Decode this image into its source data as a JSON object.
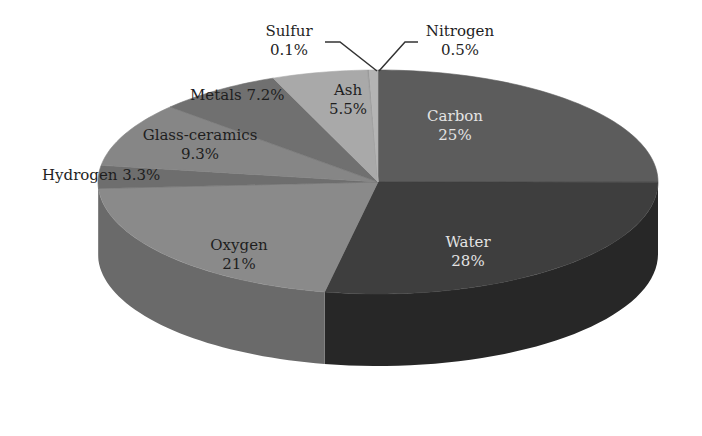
{
  "chart_data": {
    "type": "pie",
    "variant": "3d-pie",
    "title": "",
    "start_angle_deg": 0,
    "direction": "clockwise",
    "categories": [
      "Carbon",
      "Water",
      "Oxygen",
      "Hydrogen",
      "Glass-ceramics",
      "Metals",
      "Ash",
      "Sulfur",
      "Nitrogen"
    ],
    "values": [
      25,
      28,
      21,
      3.3,
      9.3,
      7.2,
      5.5,
      0.1,
      0.5
    ],
    "unit": "%",
    "slices": [
      {
        "name": "Carbon",
        "value": 25,
        "label": "Carbon",
        "pct": "25%",
        "top": "#5c5c5c",
        "side": "#444444",
        "text": "light"
      },
      {
        "name": "Water",
        "value": 28,
        "label": "Water",
        "pct": "28%",
        "top": "#3e3e3e",
        "side": "#272727",
        "text": "light"
      },
      {
        "name": "Oxygen",
        "value": 21,
        "label": "Oxygen",
        "pct": "21%",
        "top": "#8a8a8a",
        "side": "#6a6a6a",
        "text": "dark"
      },
      {
        "name": "Hydrogen",
        "value": 3.3,
        "label": "Hydrogen",
        "pct": "3.3%",
        "top": "#6e6e6e",
        "side": "#565656",
        "text": "dark"
      },
      {
        "name": "Glass-ceramics",
        "value": 9.3,
        "label": "Glass-ceramics",
        "pct": "9.3%",
        "top": "#868686",
        "side": "#686868",
        "text": "dark"
      },
      {
        "name": "Metals",
        "value": 7.2,
        "label": "Metals",
        "pct": "7.2%",
        "top": "#707070",
        "side": "#575757",
        "text": "dark"
      },
      {
        "name": "Ash",
        "value": 5.5,
        "label": "Ash",
        "pct": "5.5%",
        "top": "#a9a9a9",
        "side": "#8a8a8a",
        "text": "dark"
      },
      {
        "name": "Sulfur",
        "value": 0.1,
        "label": "Sulfur",
        "pct": "0.1%",
        "top": "#9a9a9a",
        "side": "#7c7c7c",
        "text": "dark"
      },
      {
        "name": "Nitrogen",
        "value": 0.5,
        "label": "Nitrogen",
        "pct": "0.5%",
        "top": "#b4b4b4",
        "side": "#949494",
        "text": "dark"
      }
    ],
    "legend": "none (inline data labels)",
    "grid": false
  },
  "labels": {
    "carbon": {
      "name": "Carbon",
      "pct": "25%"
    },
    "water": {
      "name": "Water",
      "pct": "28%"
    },
    "oxygen": {
      "name": "Oxygen",
      "pct": "21%"
    },
    "hydrogen": {
      "text": "Hydrogen 3.3%"
    },
    "glass": {
      "name": "Glass-ceramics",
      "pct": "9.3%"
    },
    "metals": {
      "text": "Metals 7.2%"
    },
    "ash": {
      "name": "Ash",
      "pct": "5.5%"
    },
    "sulfur": {
      "name": "Sulfur",
      "pct": "0.1%"
    },
    "nitrogen": {
      "name": "Nitrogen",
      "pct": "0.5%"
    }
  }
}
